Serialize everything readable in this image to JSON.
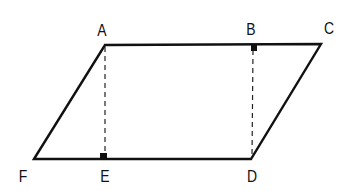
{
  "diagram": {
    "type": "geometry",
    "colors": {
      "stroke": "#111111",
      "background": "#ffffff"
    },
    "vertices": {
      "A": {
        "x": 105,
        "y": 45
      },
      "B": {
        "x": 253,
        "y": 45
      },
      "C": {
        "x": 321,
        "y": 44
      },
      "D": {
        "x": 251,
        "y": 159
      },
      "E": {
        "x": 104,
        "y": 159
      },
      "F": {
        "x": 34,
        "y": 159
      }
    },
    "labels": [
      {
        "text": "A",
        "x": 102,
        "y": 30
      },
      {
        "text": "B",
        "x": 251,
        "y": 29
      },
      {
        "text": "C",
        "x": 329,
        "y": 28
      },
      {
        "text": "D",
        "x": 252,
        "y": 176
      },
      {
        "text": "E",
        "x": 105,
        "y": 176
      },
      {
        "text": "F",
        "x": 23,
        "y": 176
      }
    ],
    "solid_segments": [
      "AC",
      "CD",
      "DF",
      "FA"
    ],
    "dashed_segments": [
      "AE",
      "BD"
    ],
    "right_angle_marks": [
      "B",
      "E"
    ]
  }
}
